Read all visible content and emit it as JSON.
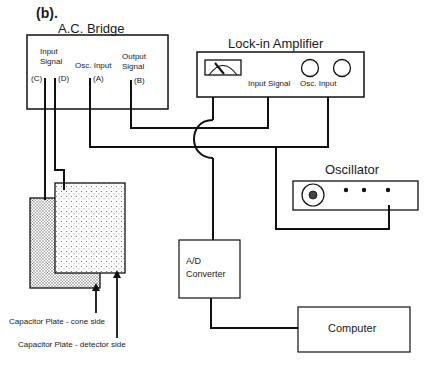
{
  "figure": {
    "label": "(b)."
  },
  "ac_bridge": {
    "title": "A.C. Bridge",
    "ports": [
      {
        "label": "Input\nSignal",
        "line1": "Input",
        "line2": "Signal"
      },
      {
        "label": "(C)"
      },
      {
        "label": "(D)"
      },
      {
        "label": "Osc. Input"
      },
      {
        "label": "(A)"
      },
      {
        "line1": "Output",
        "line2": "Signal"
      },
      {
        "label": "(B)"
      }
    ]
  },
  "lockin": {
    "title": "Lock-in   Amplifier",
    "input_signal": "Input Signal",
    "osc_input": "Osc. Input"
  },
  "oscillator": {
    "title": "Oscillator"
  },
  "adc": {
    "line1": "A/D",
    "line2": "Converter"
  },
  "computer": {
    "title": "Computer"
  },
  "capacitor": {
    "cone_label": "Capacitor Plate - cone side",
    "detector_label": "Capacitor Plate - detector side"
  },
  "colors": {
    "line": "#111111",
    "background": "#ffffff"
  }
}
